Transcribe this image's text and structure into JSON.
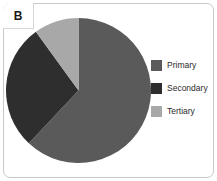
{
  "panel": {
    "label": "B",
    "background_color": "#ffffff",
    "border_color": "#c9c9c9"
  },
  "chart_data": {
    "type": "pie",
    "title": "",
    "subtitle": "",
    "xlabel": "",
    "ylabel": "",
    "grid": false,
    "legend_position": "right",
    "start_angle_deg": 0,
    "direction": "clockwise",
    "categories": [
      "Primary",
      "Secondary",
      "Tertiary"
    ],
    "values": [
      62,
      28,
      10
    ],
    "colors": [
      "#5a5a5a",
      "#2e2e2e",
      "#a8a8a8"
    ],
    "slices": [
      {
        "label": "Primary",
        "value": 62,
        "color": "#5a5a5a",
        "start_deg": 0,
        "end_deg": 223.2
      },
      {
        "label": "Secondary",
        "value": 28,
        "color": "#2e2e2e",
        "start_deg": 223.2,
        "end_deg": 324.0
      },
      {
        "label": "Tertiary",
        "value": 10,
        "color": "#a8a8a8",
        "start_deg": 324.0,
        "end_deg": 360.0
      }
    ]
  },
  "legend": {
    "items": [
      {
        "label": "Primary",
        "color": "#5a5a5a"
      },
      {
        "label": "Secondary",
        "color": "#2e2e2e"
      },
      {
        "label": "Tertiary",
        "color": "#a8a8a8"
      }
    ]
  }
}
